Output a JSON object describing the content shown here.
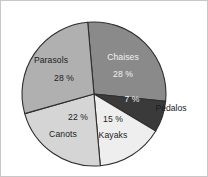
{
  "chart_data": {
    "type": "pie",
    "title": "",
    "subtitle": "",
    "xlabel": "",
    "ylabel": "",
    "legend_position": "none",
    "grid": false,
    "percent_suffix": " %",
    "total": 100,
    "categories": [
      "Chaises",
      "Pédalos",
      "Kayaks",
      "Canots",
      "Parasols"
    ],
    "values": [
      28,
      7,
      15,
      22,
      28
    ],
    "slices": [
      {
        "name": "Chaises",
        "value": 28,
        "value_text": "28 %",
        "color": "#8a8a8a",
        "label_placement": "inside",
        "label_color": "#f2f2f2",
        "name_x": 122,
        "name_y": 59,
        "value_x": 122,
        "value_y": 76
      },
      {
        "name": "Pédalos",
        "value": 7,
        "value_text": "7 %",
        "color": "#3a3a3a",
        "label_placement": "outside-right",
        "label_color": "#1c1c1c",
        "name_x": 170,
        "name_y": 110,
        "value_x": 131,
        "value_y": 101
      },
      {
        "name": "Kayaks",
        "value": 15,
        "value_text": "15 %",
        "color": "#eeeeee",
        "label_placement": "inside",
        "label_color": "#1c1c1c",
        "name_x": 112,
        "name_y": 137,
        "value_x": 112,
        "value_y": 121
      },
      {
        "name": "Canots",
        "value": 22,
        "value_text": "22 %",
        "color": "#d5d5d5",
        "label_placement": "inside",
        "label_color": "#1c1c1c",
        "name_x": 62,
        "name_y": 136,
        "value_x": 77,
        "value_y": 119
      },
      {
        "name": "Parasols",
        "value": 28,
        "value_text": "28 %",
        "color": "#b0b0b0",
        "label_placement": "inside",
        "label_color": "#1c1c1c",
        "name_x": 50,
        "name_y": 62,
        "value_x": 63,
        "value_y": 80
      }
    ],
    "geometry": {
      "center_x": 93,
      "center_y": 93,
      "radius": 72,
      "start_angle_deg": -5,
      "direction": "clockwise"
    },
    "style": {
      "background": "#ffffff",
      "slice_outline": "#2e2e2e",
      "frame_border": "#c8c8c8"
    }
  }
}
